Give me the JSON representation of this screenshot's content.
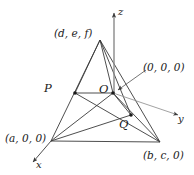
{
  "figure": {
    "type": "geometry-diagram",
    "stroke_color": "#3a3a3a",
    "text_color": "#1a1a1a",
    "background_color": "#ffffff",
    "labels": {
      "apex": "(d, e, f)",
      "origin_coords": "(0, 0, 0)",
      "x_vertex": "(a, 0, 0)",
      "y_vertex": "(b, c, 0)",
      "point_p": "P",
      "point_q": "Q",
      "point_o": "O",
      "axis_x": "x",
      "axis_y": "y",
      "axis_z": "z"
    },
    "points": {
      "apex": {
        "x": 100,
        "y": 40
      },
      "origin": {
        "x": 113,
        "y": 93
      },
      "x_vertex": {
        "x": 51,
        "y": 141
      },
      "y_vertex": {
        "x": 160,
        "y": 142
      },
      "p": {
        "x": 75,
        "y": 93
      },
      "q": {
        "x": 131,
        "y": 115
      }
    },
    "axes": {
      "x_tip": {
        "x": 31,
        "y": 164
      },
      "y_tip": {
        "x": 180,
        "y": 116
      },
      "z_tip": {
        "x": 114,
        "y": 10
      }
    }
  }
}
